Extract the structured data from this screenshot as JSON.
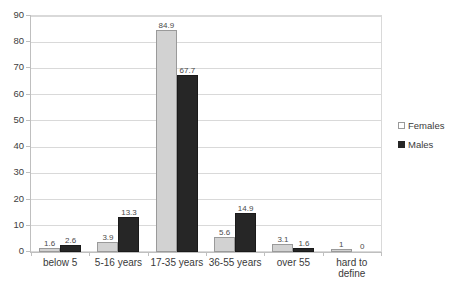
{
  "chart_data": {
    "type": "bar",
    "title": "",
    "subtitle": "",
    "xlabel": "",
    "ylabel": "",
    "ylim": [
      0,
      90
    ],
    "ytick_step": 10,
    "yticks": [
      "90",
      "80",
      "70",
      "60",
      "50",
      "40",
      "30",
      "20",
      "10",
      "0"
    ],
    "grid": "horizontal",
    "legend_position": "right-middle",
    "categories": [
      "below 5",
      "5-16 years",
      "17-35 years",
      "36-55 years",
      "over 55",
      "hard to define"
    ],
    "series": [
      {
        "name": "Females",
        "color": "#d2d2d2",
        "values": [
          1.6,
          3.9,
          84.9,
          5.6,
          3.1,
          1
        ],
        "labels": [
          "1.6",
          "3.9",
          "84.9",
          "5.6",
          "3.1",
          "1"
        ]
      },
      {
        "name": "Males",
        "color": "#262626",
        "values": [
          2.6,
          13.3,
          67.7,
          14.9,
          1.6,
          0
        ],
        "labels": [
          "2.6",
          "13.3",
          "67.7",
          "14.9",
          "1.6",
          "0"
        ]
      }
    ]
  },
  "legend": {
    "items": [
      {
        "label": "Females",
        "marker": "open-square-marker"
      },
      {
        "label": "Males",
        "marker": "filled-square-marker"
      }
    ]
  },
  "colors": {
    "females": "#d2d2d2",
    "males": "#262626",
    "gridline": "#d9d9d9",
    "axis": "#bfbfbf",
    "text": "#3a3a3a",
    "background": "#ffffff"
  }
}
